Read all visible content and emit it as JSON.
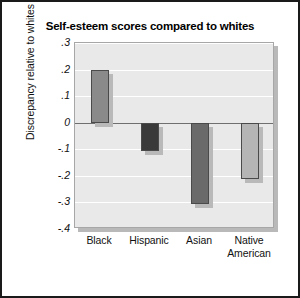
{
  "chart_data": {
    "type": "bar",
    "title": "Self-esteem scores compared to whites",
    "xlabel": "",
    "ylabel": "Discrepancy relative to whites",
    "categories": [
      "Black",
      "Hispanic",
      "Asian",
      "Native American"
    ],
    "values": [
      0.2,
      -0.105,
      -0.305,
      -0.21
    ],
    "series": [
      {
        "name": "Discrepancy relative to whites",
        "values": [
          0.2,
          -0.105,
          -0.305,
          -0.21
        ]
      }
    ],
    "ylim": [
      -0.4,
      0.3
    ],
    "yticks": [
      0.3,
      0.2,
      0.1,
      0,
      -0.1,
      -0.2,
      -0.3,
      -0.4
    ],
    "ytick_labels": [
      ".3",
      ".2",
      ".1",
      "0",
      "-.1",
      "-.2",
      "-.3",
      "-.4"
    ],
    "grid": true,
    "legend": "none",
    "bar_colors": [
      "#8a8a8a",
      "#3a3a3a",
      "#6a6a6a",
      "#b5b5b5"
    ],
    "plot_background": "#e9e9e9",
    "gridline_color": "#ffffff",
    "zero_line_color": "#6f6f6f",
    "bar_border_color": "#4a4a4a",
    "figure_border_color": "#1a1a1a",
    "text_color": "#111111"
  },
  "category_label_lines": [
    [
      "Black"
    ],
    [
      "Hispanic"
    ],
    [
      "Asian"
    ],
    [
      "Native",
      "American"
    ]
  ]
}
